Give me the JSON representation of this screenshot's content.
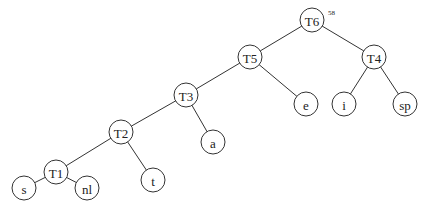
{
  "diagram": {
    "type": "binary-tree",
    "root_weight": "58",
    "nodes": [
      {
        "id": "T6",
        "label": "T6",
        "x": 312,
        "y": 20
      },
      {
        "id": "T5",
        "label": "T5",
        "x": 250,
        "y": 57
      },
      {
        "id": "T4",
        "label": "T4",
        "x": 374,
        "y": 57
      },
      {
        "id": "T3",
        "label": "T3",
        "x": 186,
        "y": 95
      },
      {
        "id": "e",
        "label": "e",
        "x": 306,
        "y": 104
      },
      {
        "id": "i",
        "label": "i",
        "x": 344,
        "y": 104
      },
      {
        "id": "sp",
        "label": "sp",
        "x": 405,
        "y": 104
      },
      {
        "id": "T2",
        "label": "T2",
        "x": 121,
        "y": 132
      },
      {
        "id": "a",
        "label": "a",
        "x": 213,
        "y": 142
      },
      {
        "id": "T1",
        "label": "T1",
        "x": 56,
        "y": 172
      },
      {
        "id": "t",
        "label": "t",
        "x": 153,
        "y": 180
      },
      {
        "id": "s",
        "label": "s",
        "x": 24,
        "y": 188
      },
      {
        "id": "nl",
        "label": "nl",
        "x": 87,
        "y": 188
      }
    ],
    "edges": [
      [
        "T6",
        "T5"
      ],
      [
        "T6",
        "T4"
      ],
      [
        "T5",
        "T3"
      ],
      [
        "T5",
        "e"
      ],
      [
        "T4",
        "i"
      ],
      [
        "T4",
        "sp"
      ],
      [
        "T3",
        "T2"
      ],
      [
        "T3",
        "a"
      ],
      [
        "T2",
        "T1"
      ],
      [
        "T2",
        "t"
      ],
      [
        "T1",
        "s"
      ],
      [
        "T1",
        "nl"
      ]
    ]
  }
}
